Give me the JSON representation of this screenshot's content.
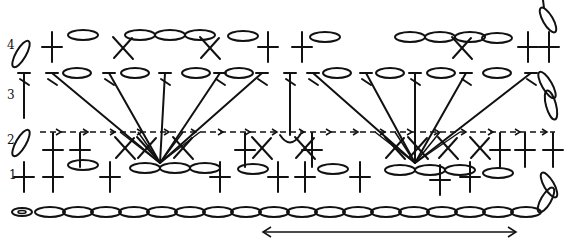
{
  "diagram": {
    "type": "crochet-stitch-chart",
    "row_labels": [
      {
        "label": "4",
        "x": 7,
        "y": 40
      },
      {
        "label": "3",
        "x": 7,
        "y": 90
      },
      {
        "label": "2",
        "x": 7,
        "y": 135
      },
      {
        "label": "1",
        "x": 9,
        "y": 170
      }
    ],
    "foundation_chain": {
      "y": 212,
      "x_start": 36,
      "x_end": 540,
      "count": 18,
      "start_ring_x": 22
    },
    "repeat_arrow": {
      "y": 232,
      "x_start": 263,
      "x_end": 516,
      "label": "repeat"
    },
    "row1": {
      "dc_x": [
        24,
        53,
        110,
        220,
        278,
        305,
        360,
        470
      ],
      "cross_y": 177,
      "chain_ovals": [
        {
          "cx": 83,
          "cy": 165
        },
        {
          "cx": 145,
          "cy": 168
        },
        {
          "cx": 175,
          "cy": 168
        },
        {
          "cx": 205,
          "cy": 168
        },
        {
          "cx": 253,
          "cy": 169
        },
        {
          "cx": 333,
          "cy": 169
        },
        {
          "cx": 400,
          "cy": 170
        },
        {
          "cx": 430,
          "cy": 170
        },
        {
          "cx": 460,
          "cy": 170
        },
        {
          "cx": 498,
          "cy": 173
        }
      ],
      "turn_ovals": [
        {
          "cx": 549,
          "cy": 185,
          "angle": 60
        },
        {
          "cx": 546,
          "cy": 200,
          "angle": -60
        }
      ]
    },
    "row2": {
      "dashed_line": {
        "y": 132,
        "x_start": 40,
        "x_end": 555
      },
      "dc_x": [
        53,
        80,
        245,
        312,
        500,
        525,
        553
      ],
      "x_stitches": [
        125,
        147,
        183,
        262,
        305,
        395,
        418,
        448,
        480
      ],
      "fan_centers": [
        {
          "x": 160,
          "y": 163
        },
        {
          "x": 415,
          "y": 163
        }
      ],
      "turn_oval": {
        "cx": 21,
        "cy": 143,
        "angle": -60
      },
      "hook": {
        "x": 290,
        "y": 140
      }
    },
    "row3": {
      "t_tops_x": [
        24,
        52,
        109,
        165,
        220,
        262,
        290,
        313,
        366,
        415,
        466,
        531
      ],
      "y": 73,
      "ovals_x": [
        77,
        135,
        196,
        239,
        337,
        390,
        441,
        497
      ],
      "fan1_tops": [
        52,
        109,
        165,
        220,
        262
      ],
      "fan2_tops": [
        313,
        366,
        415,
        466,
        531
      ],
      "right_turn_ovals": [
        {
          "cx": 547,
          "cy": 85,
          "angle": 60
        },
        {
          "cx": 551,
          "cy": 105,
          "angle": 75
        }
      ],
      "left_vertical_x": 24
    },
    "row4": {
      "dc_x": [
        52,
        268,
        302,
        528,
        549
      ],
      "x_stitches": [
        123,
        210,
        462
      ],
      "cross_y": 47,
      "ovals": [
        {
          "cx": 83,
          "cy": 35
        },
        {
          "cx": 140,
          "cy": 35
        },
        {
          "cx": 170,
          "cy": 35
        },
        {
          "cx": 200,
          "cy": 35
        },
        {
          "cx": 243,
          "cy": 36
        },
        {
          "cx": 325,
          "cy": 37
        },
        {
          "cx": 410,
          "cy": 37
        },
        {
          "cx": 440,
          "cy": 37
        },
        {
          "cx": 470,
          "cy": 37
        },
        {
          "cx": 497,
          "cy": 38
        }
      ],
      "turn_oval": {
        "cx": 21,
        "cy": 54,
        "angle": -60
      },
      "top_right_oval": {
        "cx": 548,
        "cy": 20,
        "angle": 60
      }
    },
    "colors": {
      "ink": "#111111",
      "background": "#ffffff"
    }
  }
}
